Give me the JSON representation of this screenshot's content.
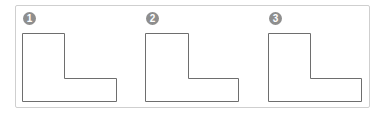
{
  "figure": {
    "panels": [
      {
        "label": "1",
        "badge_x": 23,
        "shape": "L-shape"
      },
      {
        "label": "2",
        "badge_x": 146,
        "shape": "L-shape"
      },
      {
        "label": "3",
        "badge_x": 269,
        "shape": "L-shape"
      }
    ],
    "colors": {
      "frame": "#cfcfcf",
      "outline": "#6e6e6e",
      "badge": "#8e8e8e"
    }
  }
}
